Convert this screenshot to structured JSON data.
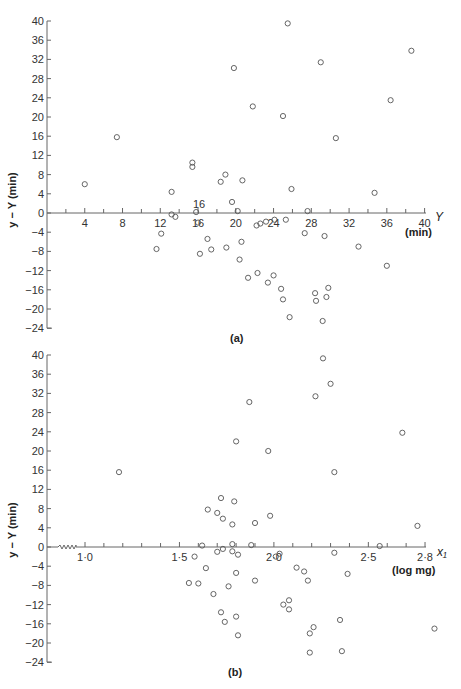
{
  "chart_data": [
    {
      "type": "scatter",
      "panel_label": "(a)",
      "title": "",
      "xlabel": "Y",
      "xunit": "(min)",
      "ylabel": "y − Y (min)",
      "xlim": [
        0,
        40
      ],
      "ylim": [
        -24,
        40
      ],
      "xticks": [
        4,
        8,
        12,
        16,
        20,
        24,
        28,
        32,
        36,
        40
      ],
      "yticks": [
        40,
        36,
        32,
        28,
        24,
        20,
        16,
        12,
        8,
        4,
        0,
        -4,
        -8,
        -12,
        -16,
        -20,
        -24
      ],
      "annotations": [
        {
          "text": "16",
          "x": 16,
          "y": 1.5
        }
      ],
      "points": [
        [
          4.0,
          6.0
        ],
        [
          7.4,
          15.8
        ],
        [
          11.6,
          -7.5
        ],
        [
          12.1,
          -4.3
        ],
        [
          13.2,
          4.4
        ],
        [
          13.2,
          -0.3
        ],
        [
          13.6,
          -0.8
        ],
        [
          15.4,
          10.5
        ],
        [
          15.4,
          9.6
        ],
        [
          15.8,
          0.2
        ],
        [
          16.0,
          -2.0
        ],
        [
          16.2,
          -8.5
        ],
        [
          17.0,
          -5.4
        ],
        [
          17.4,
          -7.6
        ],
        [
          18.4,
          6.5
        ],
        [
          18.9,
          8.0
        ],
        [
          19.0,
          -7.2
        ],
        [
          19.6,
          2.3
        ],
        [
          19.8,
          30.2
        ],
        [
          20.2,
          0.4
        ],
        [
          20.4,
          -9.7
        ],
        [
          20.7,
          6.8
        ],
        [
          20.6,
          -6.0
        ],
        [
          21.3,
          -13.5
        ],
        [
          21.8,
          22.2
        ],
        [
          22.3,
          -12.5
        ],
        [
          22.2,
          -2.6
        ],
        [
          22.6,
          -2.2
        ],
        [
          23.2,
          -1.8
        ],
        [
          23.4,
          -14.5
        ],
        [
          24.1,
          -1.4
        ],
        [
          24.0,
          -13.0
        ],
        [
          24.8,
          -15.8
        ],
        [
          25.0,
          20.2
        ],
        [
          25.0,
          -18.0
        ],
        [
          25.3,
          -1.4
        ],
        [
          25.5,
          39.5
        ],
        [
          25.7,
          -21.7
        ],
        [
          25.9,
          5.0
        ],
        [
          27.6,
          0.4
        ],
        [
          27.3,
          -4.2
        ],
        [
          28.4,
          -16.7
        ],
        [
          28.5,
          -18.3
        ],
        [
          29.0,
          31.4
        ],
        [
          29.4,
          -4.8
        ],
        [
          29.2,
          -22.5
        ],
        [
          29.6,
          -17.5
        ],
        [
          29.8,
          -15.6
        ],
        [
          30.6,
          15.6
        ],
        [
          33.0,
          -7.0
        ],
        [
          34.7,
          4.2
        ],
        [
          36.0,
          -11.0
        ],
        [
          36.4,
          23.5
        ],
        [
          38.6,
          33.8
        ]
      ]
    },
    {
      "type": "scatter",
      "panel_label": "(b)",
      "title": "",
      "xlabel": "x₁",
      "xunit": "(log mg)",
      "ylabel": "y − Y (min)",
      "xlim": [
        0.8,
        2.8
      ],
      "ylim": [
        -24,
        40
      ],
      "xticks": [
        "1·0",
        "1·5",
        "2·0",
        "2·5",
        "2·8"
      ],
      "xtick_values": [
        1.0,
        1.5,
        2.0,
        2.5,
        2.8
      ],
      "yticks": [
        40,
        36,
        32,
        28,
        24,
        20,
        16,
        12,
        8,
        4,
        0,
        -4,
        -8,
        -12,
        -16,
        -20,
        -24
      ],
      "axis_break": "zigzag on x-axis between 0.8 and 1.0",
      "points": [
        [
          1.18,
          15.6
        ],
        [
          1.55,
          -7.5
        ],
        [
          1.58,
          -2.0
        ],
        [
          1.6,
          -7.6
        ],
        [
          1.62,
          0.3
        ],
        [
          1.64,
          -4.4
        ],
        [
          1.65,
          7.8
        ],
        [
          1.68,
          -9.8
        ],
        [
          1.7,
          -1.0
        ],
        [
          1.7,
          7.1
        ],
        [
          1.72,
          -13.6
        ],
        [
          1.72,
          10.2
        ],
        [
          1.73,
          -0.4
        ],
        [
          1.73,
          5.9
        ],
        [
          1.74,
          -15.6
        ],
        [
          1.76,
          -8.2
        ],
        [
          1.78,
          -0.9
        ],
        [
          1.78,
          4.7
        ],
        [
          1.78,
          0.6
        ],
        [
          1.79,
          9.5
        ],
        [
          1.8,
          -5.4
        ],
        [
          1.8,
          22.0
        ],
        [
          1.8,
          -14.5
        ],
        [
          1.81,
          -18.4
        ],
        [
          1.81,
          -1.6
        ],
        [
          1.87,
          30.2
        ],
        [
          1.88,
          0.4
        ],
        [
          1.9,
          5.0
        ],
        [
          1.9,
          -7.0
        ],
        [
          1.97,
          20.0
        ],
        [
          1.98,
          6.5
        ],
        [
          2.01,
          -2.0
        ],
        [
          2.03,
          -1.4
        ],
        [
          2.05,
          -12.0
        ],
        [
          2.08,
          -11.1
        ],
        [
          2.08,
          -13.0
        ],
        [
          2.12,
          -4.3
        ],
        [
          2.16,
          -5.1
        ],
        [
          2.18,
          -7.0
        ],
        [
          2.19,
          -18.0
        ],
        [
          2.19,
          -22.0
        ],
        [
          2.21,
          -16.7
        ],
        [
          2.22,
          31.4
        ],
        [
          2.26,
          39.3
        ],
        [
          2.3,
          34.0
        ],
        [
          2.32,
          15.6
        ],
        [
          2.32,
          -1.2
        ],
        [
          2.35,
          -15.2
        ],
        [
          2.36,
          -21.7
        ],
        [
          2.39,
          -5.6
        ],
        [
          2.56,
          0.2
        ],
        [
          2.68,
          23.8
        ],
        [
          2.76,
          4.4
        ],
        [
          2.85,
          -17.0
        ]
      ]
    }
  ],
  "panel_a": {
    "label": "(a)",
    "y_axis_title": "y − Y (min)",
    "x_axis_var": "Y",
    "x_axis_unit": "(min)",
    "annotation": "16",
    "x_tick_labels": [
      "4",
      "8",
      "12",
      "16",
      "20",
      "24",
      "28",
      "32",
      "36",
      "40"
    ],
    "y_tick_labels": [
      "40",
      "36",
      "32",
      "28",
      "24",
      "20",
      "16",
      "12",
      "8",
      "4",
      "0",
      "−4",
      "−8",
      "−12",
      "−16",
      "−20",
      "−24"
    ]
  },
  "panel_b": {
    "label": "(b)",
    "y_axis_title": "y − Y (min)",
    "x_axis_var": "x₁",
    "x_axis_unit": "(log mg)",
    "x_tick_labels": [
      "1·0",
      "1·5",
      "2·0",
      "2·5",
      "2·8"
    ],
    "y_tick_labels": [
      "40",
      "36",
      "32",
      "28",
      "24",
      "20",
      "16",
      "12",
      "8",
      "4",
      "0",
      "−4",
      "−8",
      "−12",
      "−16",
      "−20",
      "−24"
    ]
  }
}
